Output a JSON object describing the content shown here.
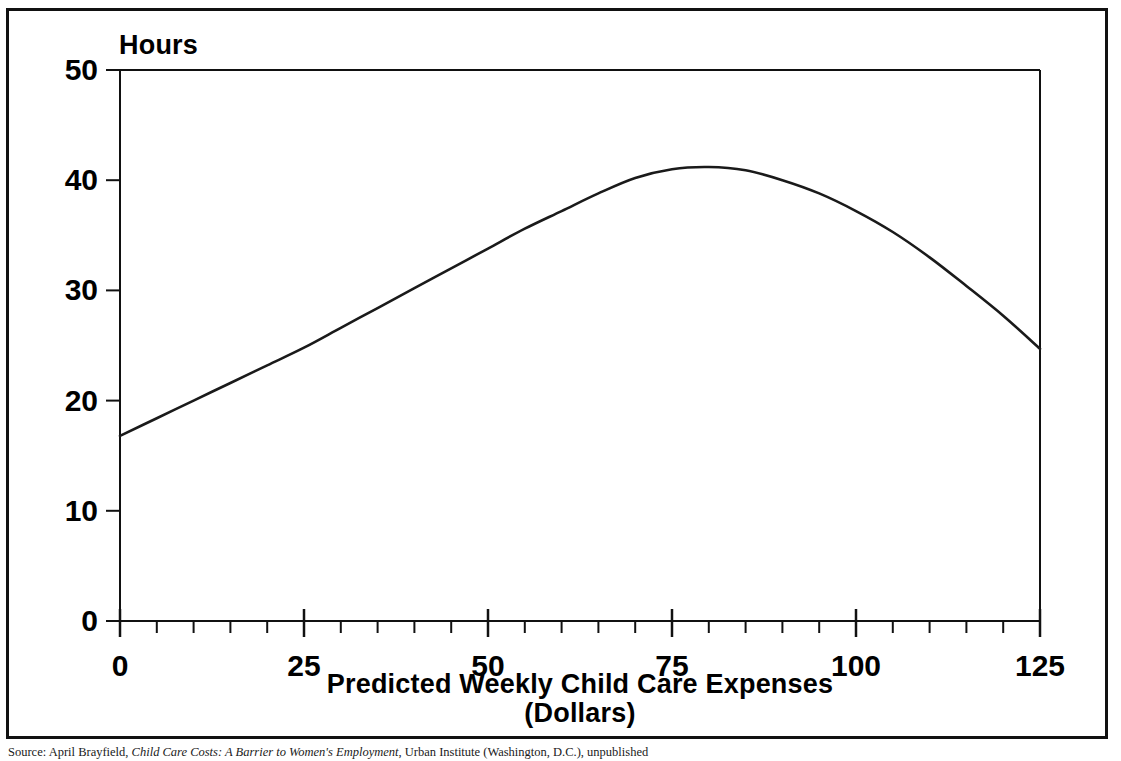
{
  "figure": {
    "y_axis_title": "Hours",
    "x_axis_title_line1": "Predicted Weekly Child Care Expenses",
    "x_axis_title_line2": "(Dollars)"
  },
  "source_note": {
    "label": "Source:",
    "author": "April Brayfield,",
    "work_title": "Child Care Costs: A Barrier to Women's Employment",
    "publisher": ", Urban Institute (Washington, D.C.), unpublished"
  },
  "chart_data": {
    "type": "line",
    "title": "",
    "xlabel": "Predicted Weekly Child Care Expenses (Dollars)",
    "ylabel": "Hours",
    "xlim": [
      0,
      125
    ],
    "ylim": [
      0,
      50
    ],
    "grid": false,
    "legend": "none",
    "x_ticks_major": [
      0,
      25,
      50,
      75,
      100,
      125
    ],
    "x_tick_labels": [
      "0",
      "25",
      "50",
      "75",
      "100",
      "125"
    ],
    "x_minor_tick_step": 5,
    "y_ticks_major": [
      0,
      10,
      20,
      30,
      40,
      50
    ],
    "y_tick_labels": [
      "0",
      "10",
      "20",
      "30",
      "40",
      "50"
    ],
    "series": [
      {
        "name": "Predicted hours worked",
        "x": [
          0,
          5,
          10,
          15,
          20,
          25,
          30,
          35,
          40,
          45,
          50,
          55,
          60,
          65,
          70,
          75,
          80,
          85,
          90,
          95,
          100,
          105,
          110,
          115,
          120,
          125
        ],
        "y": [
          16.8,
          18.4,
          20.0,
          21.6,
          23.2,
          24.8,
          26.6,
          28.4,
          30.2,
          32.0,
          33.8,
          35.6,
          37.2,
          38.8,
          40.2,
          41.0,
          41.2,
          40.9,
          40.0,
          38.8,
          37.2,
          35.3,
          33.0,
          30.4,
          27.7,
          24.7
        ]
      }
    ],
    "peak": {
      "x": 80,
      "y": 41.2
    },
    "start": {
      "x": 0,
      "y": 16.8
    },
    "end": {
      "x": 125,
      "y": 24.7
    }
  }
}
